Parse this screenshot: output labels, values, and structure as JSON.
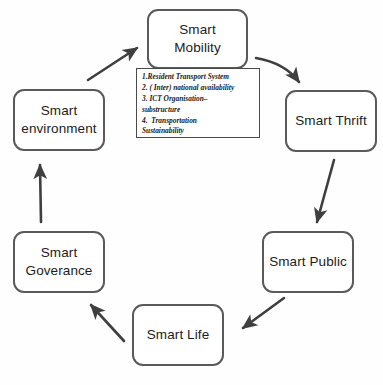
{
  "diagram": {
    "type": "cycle-diagram",
    "background_color": "#ffffff",
    "node_border_color": "#5a5a5a",
    "arrow_color": "#3f3f3f",
    "nodes": [
      {
        "id": "mobility",
        "label": "Smart\nMobility"
      },
      {
        "id": "thrift",
        "label": "Smart Thrift"
      },
      {
        "id": "public",
        "label": "Smart Public"
      },
      {
        "id": "life",
        "label": "Smart Life"
      },
      {
        "id": "goverance",
        "label": "Smart\nGoverance"
      },
      {
        "id": "environment",
        "label": "Smart\nenvironment"
      }
    ],
    "detail_box": {
      "attached_to": "mobility",
      "items": [
        "1.Resident Transport System",
        "2. ( Inter) national availability",
        "3. ICT Organisation–",
        "substructure",
        "4.  Transportation",
        "Sustainability"
      ]
    },
    "arrows": [
      {
        "from": "mobility",
        "to": "thrift"
      },
      {
        "from": "thrift",
        "to": "public"
      },
      {
        "from": "public",
        "to": "life"
      },
      {
        "from": "life",
        "to": "goverance"
      },
      {
        "from": "goverance",
        "to": "environment"
      },
      {
        "from": "environment",
        "to": "mobility"
      }
    ]
  }
}
